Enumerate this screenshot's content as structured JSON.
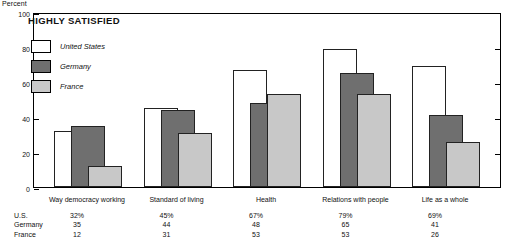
{
  "axis_unit_label": "Percent",
  "chart_title": "HIGHLY SATISFIED",
  "legend": {
    "items": [
      {
        "label": "United States",
        "key": "us",
        "color": "#ffffff"
      },
      {
        "label": "Germany",
        "key": "de",
        "color": "#6f6f6f"
      },
      {
        "label": "France",
        "key": "fr",
        "color": "#c8c8c8"
      }
    ]
  },
  "table": {
    "row_labels": [
      "U.S.",
      "Germany",
      "France"
    ],
    "rows": [
      [
        "32%",
        "45%",
        "67%",
        "79%",
        "69%"
      ],
      [
        "35",
        "44",
        "48",
        "65",
        "41"
      ],
      [
        "12",
        "31",
        "53",
        "53",
        "26"
      ]
    ]
  },
  "chart_data": {
    "type": "bar",
    "title": "HIGHLY SATISFIED",
    "xlabel": "",
    "ylabel": "Percent",
    "ylim": [
      0,
      100
    ],
    "yticks": [
      0,
      20,
      40,
      60,
      80,
      100
    ],
    "ytick_labels": [
      "0",
      "20",
      "40",
      "60",
      "80",
      "100"
    ],
    "grid": false,
    "legend_position": "upper-left",
    "categories": [
      "Way democracy working",
      "Standard of living",
      "Health",
      "Relations with people",
      "Life as a whole"
    ],
    "series": [
      {
        "name": "United States",
        "color": "#ffffff",
        "values": [
          32,
          45,
          67,
          79,
          69
        ]
      },
      {
        "name": "Germany",
        "color": "#6f6f6f",
        "values": [
          35,
          44,
          48,
          65,
          41
        ]
      },
      {
        "name": "France",
        "color": "#c8c8c8",
        "values": [
          12,
          31,
          53,
          53,
          26
        ]
      }
    ]
  }
}
